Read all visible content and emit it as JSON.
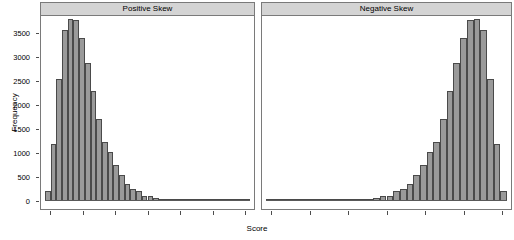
{
  "chart_data": {
    "type": "bar",
    "title": "",
    "xlabel": "Score",
    "ylabel": "Frequency",
    "ylim": [
      0,
      3850
    ],
    "grid": false,
    "legend": false,
    "y_ticks": [
      0,
      500,
      1000,
      1500,
      2000,
      2500,
      3000,
      3500
    ],
    "y_tick_labels": [
      "0",
      "500",
      "1000",
      "1500",
      "2000",
      "2500",
      "3000",
      "3500"
    ],
    "x_tick_labels": [],
    "n_x_ticks_per_panel": 7,
    "panels": [
      {
        "label": "Positive Skew",
        "values": [
          200,
          1190,
          2530,
          3550,
          3790,
          3770,
          3390,
          2880,
          2290,
          1710,
          1220,
          1030,
          750,
          540,
          350,
          250,
          200,
          110,
          95,
          60,
          40,
          30,
          22,
          18,
          14,
          10,
          8,
          6,
          5,
          4,
          3,
          2,
          2,
          1,
          1,
          1
        ]
      },
      {
        "label": "Negative Skew",
        "values": [
          1,
          1,
          1,
          2,
          2,
          3,
          4,
          5,
          6,
          8,
          10,
          14,
          18,
          22,
          30,
          40,
          60,
          95,
          110,
          200,
          250,
          350,
          540,
          750,
          1030,
          1220,
          1710,
          2290,
          2880,
          3390,
          3770,
          3790,
          3550,
          2530,
          1190,
          200
        ]
      }
    ]
  }
}
